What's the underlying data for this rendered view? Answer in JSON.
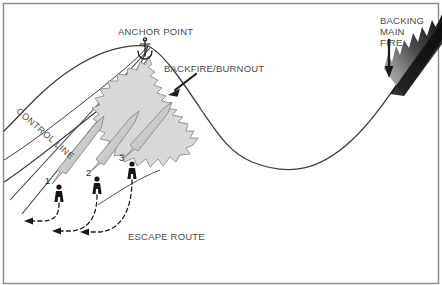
{
  "diagram": {
    "type": "wildfire-tactics-illustration",
    "frame_color": "#8a8a8a",
    "background_color": "#ffffff",
    "labels": {
      "anchor_point": "ANCHOR POINT",
      "backfire_burnout": "BACKFIRE/BURNOUT",
      "backing_main_fire": "BACKING\nMAIN\nFIRE",
      "control_line": "CONTROL LINE",
      "escape_route": "ESCAPE ROUTE"
    },
    "firefighters": [
      {
        "number": "1"
      },
      {
        "number": "2"
      },
      {
        "number": "3"
      }
    ],
    "icons": {
      "anchor": "anchor-icon",
      "backfire_arrow": "arrow-pointing-down-left-icon",
      "main_fire_arrow": "arrow-pointing-down-icon"
    },
    "colors": {
      "terrain_line": "#3c3c3c",
      "burned_area_fill": "#d8d8d8",
      "burned_area_stroke": "#8c8c8c",
      "drip_torch_fill": "#c9c9c9",
      "drip_torch_stroke": "#7d7d7d",
      "figure_fill": "#151515",
      "main_fire_dark": "#111111",
      "main_fire_light": "#bdbdbd",
      "label_text": "#4a4a4a",
      "escape_dash": "#1a1a1a"
    }
  }
}
